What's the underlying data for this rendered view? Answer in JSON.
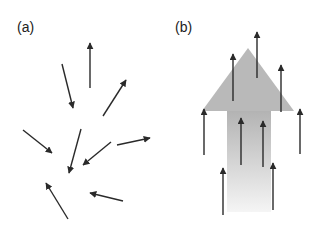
{
  "panels": [
    {
      "label": "(a)",
      "description": "randomly oriented arrows",
      "arrows": [
        {
          "x1": 90,
          "y1": 88,
          "x2": 90,
          "y2": 43
        },
        {
          "x1": 62,
          "y1": 64,
          "x2": 73,
          "y2": 108
        },
        {
          "x1": 103,
          "y1": 116,
          "x2": 126,
          "y2": 80
        },
        {
          "x1": 23,
          "y1": 130,
          "x2": 52,
          "y2": 153
        },
        {
          "x1": 81,
          "y1": 129,
          "x2": 69,
          "y2": 173
        },
        {
          "x1": 111,
          "y1": 142,
          "x2": 83,
          "y2": 165
        },
        {
          "x1": 117,
          "y1": 145,
          "x2": 150,
          "y2": 138
        },
        {
          "x1": 68,
          "y1": 219,
          "x2": 46,
          "y2": 183
        },
        {
          "x1": 123,
          "y1": 201,
          "x2": 90,
          "y2": 193
        }
      ]
    },
    {
      "label": "(b)",
      "description": "aligned arrows over large upward arrow",
      "big_arrow": {
        "apex": [
          248,
          48
        ],
        "head_left": [
          202,
          111
        ],
        "head_right": [
          294,
          111
        ],
        "shaft_left": 227,
        "shaft_right": 271,
        "shaft_bottom": 212,
        "head_color": "#b9b9b9",
        "shaft_top_color": "#b3b3b3",
        "shaft_bottom_color": "#f5f5f5"
      },
      "arrows": [
        {
          "x1": 257,
          "y1": 78,
          "x2": 257,
          "y2": 32
        },
        {
          "x1": 233,
          "y1": 101,
          "x2": 233,
          "y2": 54
        },
        {
          "x1": 281,
          "y1": 112,
          "x2": 281,
          "y2": 65
        },
        {
          "x1": 204,
          "y1": 155,
          "x2": 204,
          "y2": 109
        },
        {
          "x1": 300,
          "y1": 154,
          "x2": 300,
          "y2": 109
        },
        {
          "x1": 241,
          "y1": 165,
          "x2": 241,
          "y2": 118
        },
        {
          "x1": 263,
          "y1": 167,
          "x2": 263,
          "y2": 121
        },
        {
          "x1": 223,
          "y1": 215,
          "x2": 223,
          "y2": 168
        },
        {
          "x1": 273,
          "y1": 210,
          "x2": 273,
          "y2": 163
        }
      ]
    }
  ],
  "colors": {
    "arrow": "#2a2a2a",
    "label": "#222222",
    "background": "#ffffff"
  }
}
